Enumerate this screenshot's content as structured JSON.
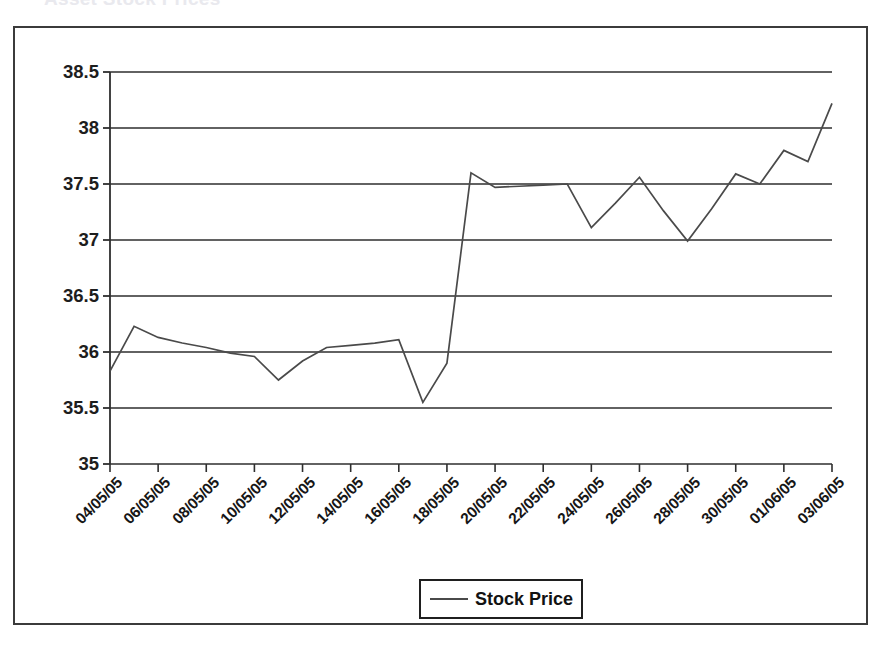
{
  "chart_data": {
    "type": "line",
    "title": "Asset Stock Prices",
    "xlabel": "",
    "ylabel": "",
    "ylim": [
      35,
      38.5
    ],
    "yticks": [
      "35",
      "35.5",
      "36",
      "36.5",
      "37",
      "37.5",
      "38",
      "38.5"
    ],
    "ytick_values": [
      35,
      35.5,
      36,
      36.5,
      37,
      37.5,
      38,
      38.5
    ],
    "grid": true,
    "legend_position": "bottom",
    "legend": [
      "Stock Price"
    ],
    "xtick_labels": [
      "04/05/05",
      "06/05/05",
      "08/05/05",
      "10/05/05",
      "12/05/05",
      "14/05/05",
      "16/05/05",
      "18/05/05",
      "20/05/05",
      "22/05/05",
      "24/05/05",
      "26/05/05",
      "28/05/05",
      "30/05/05",
      "01/06/05",
      "03/06/05"
    ],
    "x": [
      "04/05/05",
      "05/05/05",
      "06/05/05",
      "07/05/05",
      "08/05/05",
      "09/05/05",
      "10/05/05",
      "11/05/05",
      "12/05/05",
      "13/05/05",
      "14/05/05",
      "15/05/05",
      "16/05/05",
      "17/05/05",
      "18/05/05",
      "19/05/05",
      "20/05/05",
      "21/05/05",
      "22/05/05",
      "23/05/05",
      "24/05/05",
      "25/05/05",
      "26/05/05",
      "27/05/05",
      "28/05/05",
      "29/05/05",
      "30/05/05",
      "31/05/05",
      "01/06/05",
      "02/06/05",
      "03/06/05"
    ],
    "series": [
      {
        "name": "Stock Price",
        "color": "#4a4a4a",
        "values": [
          35.83,
          36.23,
          36.13,
          36.08,
          36.04,
          35.99,
          35.96,
          35.75,
          35.92,
          36.04,
          36.06,
          36.08,
          36.11,
          35.55,
          35.9,
          37.6,
          37.47,
          37.48,
          37.49,
          37.5,
          37.11,
          37.33,
          37.56,
          37.26,
          36.99,
          37.28,
          37.59,
          37.5,
          37.8,
          37.7,
          38.22
        ]
      }
    ]
  }
}
